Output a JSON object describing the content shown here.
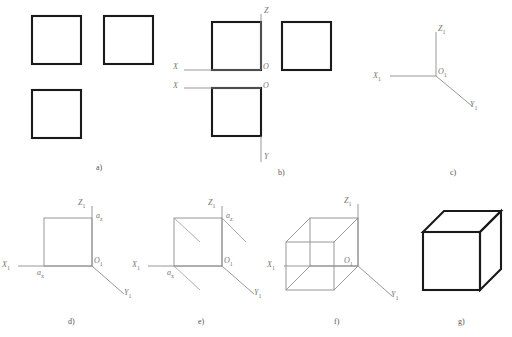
{
  "figure": {
    "panels": [
      {
        "id": "a",
        "label": "a)",
        "description": "Three orthographic views of a cube drawn as plain squares",
        "squares": 3
      },
      {
        "id": "b",
        "label": "b)",
        "description": "Orthographic views with projection axes added",
        "axis_labels": [
          "X",
          "Z",
          "X",
          "O",
          "O",
          "Y"
        ]
      },
      {
        "id": "c",
        "label": "c)",
        "description": "Axonometric axes X1, Z1, Y1 drawn from origin O1",
        "axis_labels": [
          "X",
          "Z",
          "Y",
          "O"
        ]
      },
      {
        "id": "d",
        "label": "d)",
        "description": "Front face square plotted on the axonometric axes",
        "axis_labels": [
          "X",
          "Z",
          "Y",
          "O"
        ],
        "point_labels": [
          "a",
          "a"
        ]
      },
      {
        "id": "e",
        "label": "e)",
        "description": "Depth construction lines added from square corners",
        "axis_labels": [
          "X",
          "Z",
          "Y",
          "O"
        ],
        "point_labels": [
          "a",
          "a"
        ]
      },
      {
        "id": "f",
        "label": "f)",
        "description": "Complete wireframe cube in axonometric projection",
        "axis_labels": [
          "X",
          "Z",
          "Y",
          "O"
        ]
      },
      {
        "id": "g",
        "label": "g)",
        "description": "Finished cube with visible outlines only"
      }
    ],
    "axis_names": {
      "x": "X",
      "y": "Y",
      "z": "Z",
      "origin": "O"
    },
    "subscript": "1",
    "point_x": "a",
    "point_z": "a",
    "point_sub_x": "x",
    "point_sub_z": "z",
    "colors": {
      "outline": "#1a1a1a",
      "construction": "#8d8d8d",
      "label": "#555555",
      "background": "#ffffff"
    }
  }
}
